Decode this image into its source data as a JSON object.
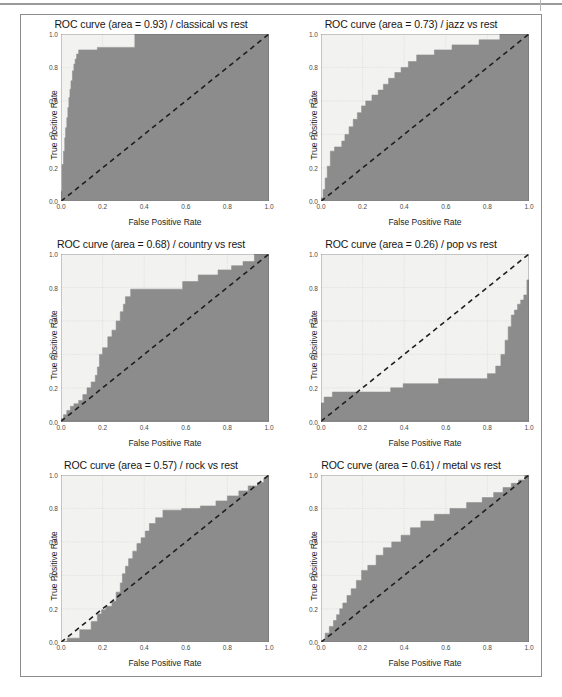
{
  "figure": {
    "panel_count": 6,
    "axis": {
      "xlabel": "False Positive Rate",
      "ylabel": "True Positive Rate",
      "xticks": [
        "0.0",
        "0.2",
        "0.4",
        "0.6",
        "0.8",
        "1.0"
      ],
      "yticks": [
        "0.0",
        "0.2",
        "0.4",
        "0.6",
        "0.8",
        "1.0"
      ],
      "xlim": [
        0.0,
        1.0
      ],
      "ylim": [
        0.0,
        1.0
      ],
      "grid": true
    },
    "colors": {
      "curve_fill": "#8c8c8c",
      "plot_background": "#f2f2f0",
      "chance_line": "#1f1f1f",
      "grid": "#c2c2c2",
      "frame_border": "#8d8d8d",
      "axis_spine": "#5a5a5a"
    }
  },
  "chart_data": [
    {
      "type": "line",
      "title": "ROC curve (area = 0.93) / classical vs rest",
      "class_label": "classical",
      "auc": 0.93,
      "xlabel": "False Positive Rate",
      "ylabel": "True Positive Rate",
      "xlim": [
        0.0,
        1.0
      ],
      "ylim": [
        0.0,
        1.0
      ],
      "grid": true,
      "legend": null,
      "series": [
        {
          "name": "ROC curve",
          "style": "step-filled",
          "x": [
            0.0,
            0.0,
            0.005,
            0.005,
            0.012,
            0.012,
            0.018,
            0.018,
            0.022,
            0.022,
            0.028,
            0.028,
            0.033,
            0.033,
            0.038,
            0.038,
            0.043,
            0.043,
            0.048,
            0.048,
            0.055,
            0.055,
            0.062,
            0.062,
            0.068,
            0.068,
            0.075,
            0.075,
            0.085,
            0.085,
            0.175,
            0.175,
            0.355,
            0.355,
            1.0
          ],
          "y": [
            0.0,
            0.06,
            0.06,
            0.22,
            0.22,
            0.3,
            0.3,
            0.38,
            0.38,
            0.44,
            0.44,
            0.5,
            0.5,
            0.56,
            0.56,
            0.62,
            0.62,
            0.67,
            0.67,
            0.72,
            0.72,
            0.78,
            0.78,
            0.82,
            0.82,
            0.85,
            0.85,
            0.88,
            0.88,
            0.905,
            0.905,
            0.92,
            0.92,
            1.0,
            1.0
          ]
        },
        {
          "name": "chance",
          "style": "dashed-diagonal",
          "x": [
            0.0,
            1.0
          ],
          "y": [
            0.0,
            1.0
          ]
        }
      ]
    },
    {
      "type": "line",
      "title": "ROC curve (area = 0.73) / jazz vs rest",
      "class_label": "jazz",
      "auc": 0.73,
      "xlabel": "False Positive Rate",
      "ylabel": "True Positive Rate",
      "xlim": [
        0.0,
        1.0
      ],
      "ylim": [
        0.0,
        1.0
      ],
      "grid": true,
      "legend": null,
      "series": [
        {
          "name": "ROC curve",
          "style": "step-filled",
          "x": [
            0.0,
            0.0,
            0.01,
            0.01,
            0.02,
            0.02,
            0.03,
            0.03,
            0.045,
            0.045,
            0.065,
            0.065,
            0.1,
            0.1,
            0.115,
            0.115,
            0.135,
            0.135,
            0.155,
            0.155,
            0.175,
            0.175,
            0.195,
            0.195,
            0.215,
            0.215,
            0.245,
            0.245,
            0.275,
            0.275,
            0.3,
            0.3,
            0.325,
            0.325,
            0.355,
            0.355,
            0.385,
            0.385,
            0.42,
            0.42,
            0.46,
            0.46,
            0.545,
            0.545,
            0.63,
            0.63,
            0.76,
            0.76,
            0.86,
            0.86,
            1.0
          ],
          "y": [
            0.0,
            0.02,
            0.02,
            0.07,
            0.07,
            0.14,
            0.14,
            0.21,
            0.21,
            0.3,
            0.3,
            0.325,
            0.325,
            0.36,
            0.36,
            0.4,
            0.4,
            0.445,
            0.445,
            0.49,
            0.49,
            0.53,
            0.53,
            0.57,
            0.57,
            0.6,
            0.6,
            0.635,
            0.635,
            0.665,
            0.665,
            0.7,
            0.7,
            0.735,
            0.735,
            0.77,
            0.77,
            0.8,
            0.8,
            0.835,
            0.835,
            0.875,
            0.875,
            0.905,
            0.905,
            0.935,
            0.935,
            0.965,
            0.965,
            1.0,
            1.0
          ]
        },
        {
          "name": "chance",
          "style": "dashed-diagonal",
          "x": [
            0.0,
            1.0
          ],
          "y": [
            0.0,
            1.0
          ]
        }
      ]
    },
    {
      "type": "line",
      "title": "ROC curve (area = 0.68) / country vs rest",
      "class_label": "country",
      "auc": 0.68,
      "xlabel": "False Positive Rate",
      "ylabel": "True Positive Rate",
      "xlim": [
        0.0,
        1.0
      ],
      "ylim": [
        0.0,
        1.0
      ],
      "grid": true,
      "legend": null,
      "series": [
        {
          "name": "ROC curve",
          "style": "step-filled",
          "x": [
            0.0,
            0.0,
            0.012,
            0.012,
            0.028,
            0.028,
            0.045,
            0.045,
            0.062,
            0.062,
            0.085,
            0.085,
            0.105,
            0.105,
            0.125,
            0.125,
            0.145,
            0.145,
            0.165,
            0.165,
            0.175,
            0.175,
            0.185,
            0.185,
            0.2,
            0.2,
            0.225,
            0.225,
            0.245,
            0.245,
            0.265,
            0.265,
            0.285,
            0.285,
            0.3,
            0.3,
            0.31,
            0.31,
            0.335,
            0.335,
            0.585,
            0.585,
            0.66,
            0.66,
            0.755,
            0.755,
            0.82,
            0.82,
            0.875,
            0.875,
            0.93,
            0.93,
            1.0
          ],
          "y": [
            0.0,
            0.015,
            0.015,
            0.04,
            0.04,
            0.065,
            0.065,
            0.09,
            0.09,
            0.105,
            0.105,
            0.125,
            0.125,
            0.16,
            0.16,
            0.2,
            0.2,
            0.235,
            0.235,
            0.275,
            0.275,
            0.325,
            0.325,
            0.4,
            0.4,
            0.44,
            0.44,
            0.505,
            0.505,
            0.545,
            0.545,
            0.6,
            0.6,
            0.655,
            0.655,
            0.7,
            0.7,
            0.745,
            0.745,
            0.79,
            0.79,
            0.835,
            0.835,
            0.875,
            0.875,
            0.905,
            0.905,
            0.93,
            0.93,
            0.955,
            0.955,
            1.0,
            1.0
          ]
        },
        {
          "name": "chance",
          "style": "dashed-diagonal",
          "x": [
            0.0,
            1.0
          ],
          "y": [
            0.0,
            1.0
          ]
        }
      ]
    },
    {
      "type": "line",
      "title": "ROC curve (area = 0.26) / pop vs rest",
      "class_label": "pop",
      "auc": 0.26,
      "xlabel": "False Positive Rate",
      "ylabel": "True Positive Rate",
      "xlim": [
        0.0,
        1.0
      ],
      "ylim": [
        0.0,
        1.0
      ],
      "grid": true,
      "legend": null,
      "series": [
        {
          "name": "ROC curve",
          "style": "step-filled",
          "x": [
            0.0,
            0.0,
            0.015,
            0.015,
            0.055,
            0.055,
            0.335,
            0.335,
            0.395,
            0.395,
            0.565,
            0.565,
            0.8,
            0.8,
            0.84,
            0.84,
            0.865,
            0.865,
            0.885,
            0.885,
            0.9,
            0.9,
            0.915,
            0.915,
            0.93,
            0.93,
            0.945,
            0.945,
            0.96,
            0.96,
            0.975,
            0.975,
            0.99,
            0.99,
            1.0
          ],
          "y": [
            0.0,
            0.11,
            0.11,
            0.145,
            0.145,
            0.175,
            0.175,
            0.2,
            0.2,
            0.225,
            0.225,
            0.255,
            0.255,
            0.285,
            0.285,
            0.33,
            0.33,
            0.4,
            0.4,
            0.485,
            0.485,
            0.565,
            0.565,
            0.635,
            0.635,
            0.665,
            0.665,
            0.7,
            0.7,
            0.725,
            0.725,
            0.755,
            0.755,
            0.845,
            0.845
          ]
        },
        {
          "name": "chance",
          "style": "dashed-diagonal",
          "x": [
            0.0,
            1.0
          ],
          "y": [
            0.0,
            1.0
          ]
        }
      ]
    },
    {
      "type": "line",
      "title": "ROC curve (area = 0.57) / rock vs rest",
      "class_label": "rock",
      "auc": 0.57,
      "xlabel": "False Positive Rate",
      "ylabel": "True Positive Rate",
      "xlim": [
        0.0,
        1.0
      ],
      "ylim": [
        0.0,
        1.0
      ],
      "grid": true,
      "legend": null,
      "series": [
        {
          "name": "ROC curve",
          "style": "step-filled",
          "x": [
            0.0,
            0.0,
            0.03,
            0.03,
            0.09,
            0.09,
            0.145,
            0.145,
            0.175,
            0.175,
            0.195,
            0.195,
            0.215,
            0.215,
            0.245,
            0.245,
            0.265,
            0.265,
            0.285,
            0.285,
            0.295,
            0.295,
            0.31,
            0.31,
            0.325,
            0.325,
            0.345,
            0.345,
            0.365,
            0.365,
            0.385,
            0.385,
            0.405,
            0.405,
            0.425,
            0.425,
            0.455,
            0.455,
            0.49,
            0.49,
            0.58,
            0.58,
            0.67,
            0.67,
            0.745,
            0.745,
            0.8,
            0.8,
            0.855,
            0.855,
            0.9,
            0.9,
            0.945,
            0.945,
            0.975,
            0.975,
            1.0
          ],
          "y": [
            0.0,
            0.005,
            0.005,
            0.025,
            0.025,
            0.075,
            0.075,
            0.125,
            0.125,
            0.17,
            0.17,
            0.195,
            0.195,
            0.215,
            0.215,
            0.245,
            0.245,
            0.3,
            0.3,
            0.355,
            0.355,
            0.41,
            0.41,
            0.455,
            0.455,
            0.5,
            0.5,
            0.545,
            0.545,
            0.59,
            0.59,
            0.625,
            0.625,
            0.665,
            0.665,
            0.71,
            0.71,
            0.745,
            0.745,
            0.79,
            0.79,
            0.8,
            0.8,
            0.815,
            0.815,
            0.845,
            0.845,
            0.875,
            0.875,
            0.905,
            0.905,
            0.935,
            0.935,
            0.955,
            0.955,
            0.98,
            1.0
          ]
        },
        {
          "name": "chance",
          "style": "dashed-diagonal",
          "x": [
            0.0,
            1.0
          ],
          "y": [
            0.0,
            1.0
          ]
        }
      ]
    },
    {
      "type": "line",
      "title": "ROC curve (area = 0.61) / metal vs rest",
      "class_label": "metal",
      "auc": 0.61,
      "xlabel": "False Positive Rate",
      "ylabel": "True Positive Rate",
      "xlim": [
        0.0,
        1.0
      ],
      "ylim": [
        0.0,
        1.0
      ],
      "grid": true,
      "legend": null,
      "series": [
        {
          "name": "ROC curve",
          "style": "step-filled",
          "x": [
            0.0,
            0.0,
            0.02,
            0.02,
            0.04,
            0.04,
            0.06,
            0.06,
            0.075,
            0.075,
            0.09,
            0.09,
            0.105,
            0.105,
            0.125,
            0.125,
            0.145,
            0.145,
            0.17,
            0.17,
            0.195,
            0.195,
            0.225,
            0.225,
            0.265,
            0.265,
            0.3,
            0.3,
            0.34,
            0.34,
            0.385,
            0.385,
            0.43,
            0.43,
            0.48,
            0.48,
            0.545,
            0.545,
            0.62,
            0.62,
            0.7,
            0.7,
            0.775,
            0.775,
            0.83,
            0.83,
            0.875,
            0.875,
            0.915,
            0.915,
            0.95,
            0.95,
            0.98,
            0.98,
            1.0
          ],
          "y": [
            0.0,
            0.01,
            0.01,
            0.055,
            0.055,
            0.095,
            0.095,
            0.13,
            0.13,
            0.165,
            0.165,
            0.2,
            0.2,
            0.235,
            0.235,
            0.28,
            0.28,
            0.32,
            0.32,
            0.37,
            0.37,
            0.43,
            0.43,
            0.46,
            0.46,
            0.52,
            0.52,
            0.565,
            0.565,
            0.6,
            0.6,
            0.64,
            0.64,
            0.685,
            0.685,
            0.725,
            0.725,
            0.765,
            0.765,
            0.8,
            0.8,
            0.835,
            0.835,
            0.865,
            0.865,
            0.895,
            0.895,
            0.925,
            0.925,
            0.95,
            0.95,
            0.97,
            0.97,
            1.0,
            1.0
          ]
        },
        {
          "name": "chance",
          "style": "dashed-diagonal",
          "x": [
            0.0,
            1.0
          ],
          "y": [
            0.0,
            1.0
          ]
        }
      ]
    }
  ]
}
